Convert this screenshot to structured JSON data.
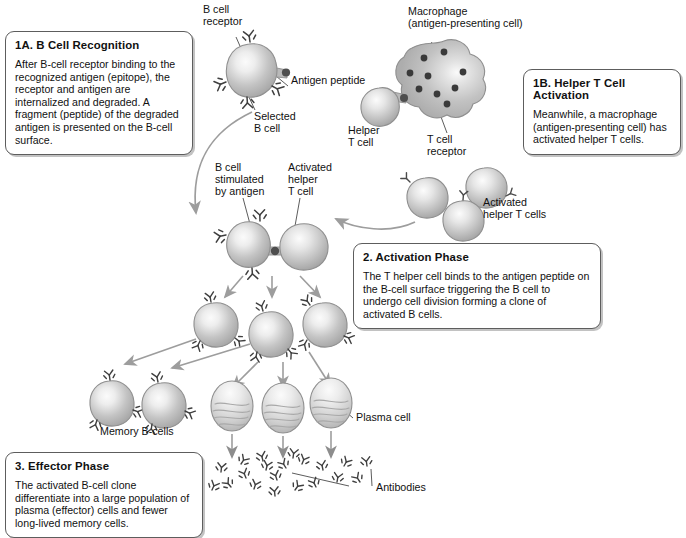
{
  "figure": {
    "domain": "biology-diagram",
    "background": "#ffffff",
    "cell_fill_light": "#f2f2f2",
    "cell_fill_mid": "#b2b2b2",
    "cell_edge": "#8a8a8a",
    "arrow_color": "#9a9a9a",
    "leader_color": "#555555",
    "text_color": "#111111"
  },
  "callouts": [
    {
      "id": "1A",
      "title": "1A. B Cell Recognition",
      "body": "After B-cell receptor binding to the recognized antigen (epitope), the receptor and antigen are internalized and degraded. A fragment (peptide) of the degraded antigen is presented on the B-cell surface."
    },
    {
      "id": "1B",
      "title": "1B. Helper T Cell Activation",
      "body": "Meanwhile, a macrophage (antigen-presenting cell) has activated helper T cells."
    },
    {
      "id": "2",
      "title": "2. Activation Phase",
      "body": "The T helper cell binds to the antigen peptide on the B-cell surface triggering the B cell to undergo cell division forming a clone of activated B cells."
    },
    {
      "id": "3",
      "title": "3. Effector Phase",
      "body": "The activated B-cell clone differentiate into a large population of plasma (effector) cells and fewer long-lived memory cells."
    }
  ],
  "labels": {
    "b_cell_receptor": "B cell\nreceptor",
    "antigen_peptide": "Antigen peptide",
    "selected_b_cell": "Selected\nB cell",
    "macrophage": "Macrophage\n(antigen-presenting cell)",
    "helper_t_cell": "Helper\nT cell",
    "t_cell_receptor": "T cell\nreceptor",
    "activated_helper_t_cells": "Activated\nhelper T cells",
    "b_cell_stimulated": "B cell\nstimulated\nby antigen",
    "activated_helper_t_cell": "Activated\nhelper\nT cell",
    "memory_b_cells": "Memory B-cells",
    "plasma_cell": "Plasma cell",
    "antibodies": "Antibodies"
  },
  "elements": {
    "selected_b_cell_receptor_count": 4,
    "macrophage_granule_count": 9,
    "activated_helper_t_cell_count": 3,
    "clone_b_cell_count": 3,
    "memory_b_cell_count": 2,
    "plasma_cell_count": 3,
    "antibody_count": 20
  }
}
